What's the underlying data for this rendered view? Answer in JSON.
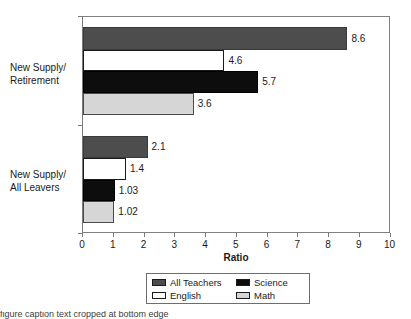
{
  "chart_data": {
    "type": "bar",
    "orientation": "horizontal",
    "title": "",
    "xlabel": "Ratio",
    "ylabel": "",
    "xlim": [
      0,
      10
    ],
    "xticks": [
      0,
      1,
      2,
      3,
      4,
      5,
      6,
      7,
      8,
      9,
      10
    ],
    "grid": false,
    "legend_position": "bottom",
    "categories": [
      "New Supply/\nRetirement",
      "New Supply/\nAll Leavers"
    ],
    "category_labels": [
      {
        "line1": "New Supply/",
        "line2": "Retirement"
      },
      {
        "line1": "New Supply/",
        "line2": "All Leavers"
      }
    ],
    "series": [
      {
        "name": "All Teachers",
        "color": "#4d4d4d",
        "values": [
          8.6,
          2.1
        ]
      },
      {
        "name": "English",
        "color": "#ffffff",
        "values": [
          4.6,
          1.4
        ]
      },
      {
        "name": "Science",
        "color": "#0d0d0d",
        "values": [
          5.7,
          1.03
        ]
      },
      {
        "name": "Math",
        "color": "#d6d6d6",
        "values": [
          3.6,
          1.02
        ]
      }
    ],
    "bars": [
      {
        "group": 0,
        "series": "All Teachers",
        "value": 8.6,
        "label": "8.6",
        "style": "all-teachers",
        "top": 27,
        "height": 23
      },
      {
        "group": 0,
        "series": "English",
        "value": 4.6,
        "label": "4.6",
        "style": "english",
        "top": 50,
        "height": 21
      },
      {
        "group": 0,
        "series": "Science",
        "value": 5.7,
        "label": "5.7",
        "style": "science",
        "top": 71,
        "height": 22
      },
      {
        "group": 0,
        "series": "Math",
        "value": 3.6,
        "label": "3.6",
        "style": "math",
        "top": 93,
        "height": 22
      },
      {
        "group": 1,
        "series": "All Teachers",
        "value": 2.1,
        "label": "2.1",
        "style": "all-teachers",
        "top": 136,
        "height": 22
      },
      {
        "group": 1,
        "series": "English",
        "value": 1.4,
        "label": "1.4",
        "style": "english",
        "top": 158,
        "height": 22
      },
      {
        "group": 1,
        "series": "Science",
        "value": 1.03,
        "label": "1.03",
        "style": "science",
        "top": 180,
        "height": 21
      },
      {
        "group": 1,
        "series": "Math",
        "value": 1.02,
        "label": "1.02",
        "style": "math",
        "top": 201,
        "height": 22
      }
    ]
  },
  "axis": {
    "x_title": "Ratio",
    "tick_labels": [
      "0",
      "1",
      "2",
      "3",
      "4",
      "5",
      "6",
      "7",
      "8",
      "9",
      "10"
    ]
  },
  "legend": {
    "entries": [
      {
        "label": "All Teachers",
        "style": "all-teachers"
      },
      {
        "label": "Science",
        "style": "science"
      },
      {
        "label": "English",
        "style": "english"
      },
      {
        "label": "Math",
        "style": "math"
      }
    ]
  },
  "caption": {
    "text": "figure caption text cropped at bottom edge"
  }
}
